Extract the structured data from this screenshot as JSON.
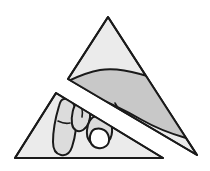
{
  "figure": {
    "title": "Hand holding two overlapping triangles",
    "style": "black line art with flat gray fills",
    "canvas": {
      "width": 210,
      "height": 171,
      "background_color": "#ffffff"
    }
  },
  "colors": {
    "background": "#ffffff",
    "triangle_fill": "#ebebeb",
    "hand_fill": "#c8c8c8",
    "hand_fill_light": "#dcdcdc",
    "nail_fill": "#ffffff",
    "outline": "#1a1a1a"
  },
  "shapes": {
    "upper_triangle": {
      "label": "Upper triangle",
      "fill": "#ebebeb",
      "stroke": "#1a1a1a",
      "stroke_width": 2,
      "points": "108,17 197,155 68,79"
    },
    "lower_triangle": {
      "label": "Lower triangle",
      "fill": "#ebebeb",
      "stroke": "#1a1a1a",
      "stroke_width": 2,
      "points": "56,93 163,158 15,158"
    },
    "palm": {
      "label": "Palm and back of hand",
      "fill": "#c8c8c8",
      "stroke": "#1a1a1a",
      "stroke_width": 2
    },
    "index_finger": {
      "label": "Index finger",
      "fill": "#dcdcdc",
      "stroke": "#1a1a1a",
      "stroke_width": 2
    },
    "middle_finger": {
      "label": "Middle finger",
      "fill": "#dcdcdc",
      "stroke": "#1a1a1a",
      "stroke_width": 2
    },
    "ring_finger": {
      "label": "Ring finger",
      "fill": "#dcdcdc",
      "stroke": "#1a1a1a",
      "stroke_width": 2
    },
    "thumbnail": {
      "label": "Fingernail",
      "fill": "#ffffff",
      "stroke": "#1a1a1a",
      "stroke_width": 2
    },
    "wrist_band": {
      "label": "Wrist separating the triangles",
      "fill": "#ffffff",
      "stroke": "#1a1a1a",
      "stroke_width": 2
    },
    "knuckle_mark": {
      "label": "Knuckle crease mark",
      "stroke": "#1a1a1a",
      "stroke_width": 1.5
    }
  }
}
